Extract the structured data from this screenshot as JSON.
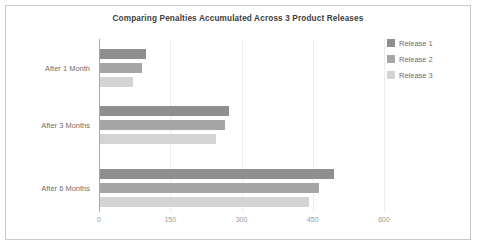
{
  "chart_data": {
    "type": "bar",
    "orientation": "horizontal",
    "title": "Comparing Penalties Accumulated Across 3 Product Releases",
    "categories": [
      "After 1 Month",
      "After 3 Months",
      "After 6 Months"
    ],
    "series": [
      {
        "name": "Release 1",
        "color": "#8f8f8f",
        "values": [
          96,
          272,
          493
        ]
      },
      {
        "name": "Release 2",
        "color": "#a6a6a6",
        "values": [
          88,
          264,
          460
        ]
      },
      {
        "name": "Release 3",
        "color": "#d4d4d4",
        "values": [
          69,
          244,
          439
        ]
      }
    ],
    "xlabel": "",
    "ylabel": "",
    "xlim": [
      0,
      600
    ],
    "xticks": [
      0,
      150,
      300,
      450,
      600
    ],
    "xtick_labels": [
      "0",
      "150",
      "300",
      "450",
      "600"
    ],
    "grid": true,
    "legend_position": "right",
    "background": "#ffffff",
    "border_color": "#c9c9c9",
    "axis_color": "#a8a8a8",
    "gridline_color": "#ececec",
    "title_color": "#3d3d3d",
    "label_color": "#6f6f6f",
    "tick_color": "#9a9a9a"
  }
}
